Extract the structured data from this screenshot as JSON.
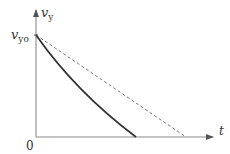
{
  "diagram": {
    "type": "velocity-time graph",
    "y_axis": {
      "label": "v",
      "subscript": "y"
    },
    "x_axis": {
      "label": "t"
    },
    "origin_label": "0",
    "initial_value_label": {
      "main": "v",
      "subscript": "yo"
    },
    "curves": [
      {
        "name": "with air resistance",
        "style": "solid",
        "shape": "slightly concave up, decreasing"
      },
      {
        "name": "without air resistance",
        "style": "dashed",
        "shape": "straight line, decreasing"
      }
    ],
    "colors": {
      "axis": "#8a8a8a",
      "solid_curve": "#333333",
      "dashed_curve": "#777777",
      "text": "#333333"
    }
  }
}
